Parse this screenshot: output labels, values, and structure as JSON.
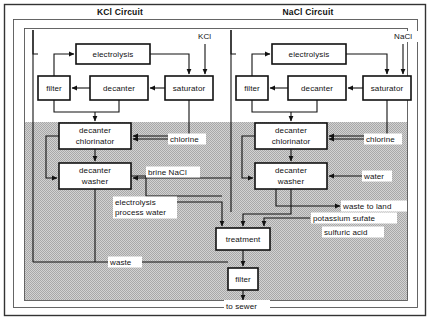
{
  "figure": {
    "type": "process-flow-diagram",
    "width": 430,
    "height": 320,
    "background_color": "#ffffff",
    "line_color": "#111111",
    "shaded_region_color": "#c8c8c8",
    "shaded_region_note": "stippled grey area covering lower portion of diagram"
  },
  "circuits": [
    {
      "id": "kcl",
      "title": "KCl Circuit"
    },
    {
      "id": "nacl",
      "title": "NaCl Circuit"
    }
  ],
  "nodes": {
    "kcl_electrolysis": {
      "label": "electrolysis",
      "x": 76,
      "y": 44,
      "w": 74,
      "h": 20
    },
    "kcl_filter": {
      "label": "filter",
      "x": 38,
      "y": 76,
      "w": 32,
      "h": 24
    },
    "kcl_decanter": {
      "label": "decanter",
      "x": 90,
      "y": 76,
      "w": 58,
      "h": 24
    },
    "kcl_saturator": {
      "label": "saturator",
      "x": 165,
      "y": 76,
      "w": 48,
      "h": 24
    },
    "kcl_decanter_chlorinator": {
      "label_line1": "decanter",
      "label_line2": "chlorinator",
      "x": 59,
      "y": 123,
      "w": 72,
      "h": 26
    },
    "kcl_decanter_washer": {
      "label_line1": "decanter",
      "label_line2": "washer",
      "x": 59,
      "y": 163,
      "w": 72,
      "h": 26
    },
    "nacl_electrolysis": {
      "label": "electrolysis",
      "x": 272,
      "y": 44,
      "w": 74,
      "h": 20
    },
    "nacl_filter": {
      "label": "filter",
      "x": 236,
      "y": 76,
      "w": 32,
      "h": 24
    },
    "nacl_decanter": {
      "label": "decanter",
      "x": 288,
      "y": 76,
      "w": 58,
      "h": 24
    },
    "nacl_saturator": {
      "label": "saturator",
      "x": 363,
      "y": 76,
      "w": 48,
      "h": 24
    },
    "nacl_decanter_chlorinator": {
      "label_line1": "decanter",
      "label_line2": "chlorinator",
      "x": 255,
      "y": 123,
      "w": 72,
      "h": 26
    },
    "nacl_decanter_washer": {
      "label_line1": "decanter",
      "label_line2": "washer",
      "x": 255,
      "y": 163,
      "w": 72,
      "h": 26
    },
    "treatment": {
      "label": "treatment",
      "x": 216,
      "y": 228,
      "w": 54,
      "h": 22
    },
    "bottom_filter": {
      "label": "filter",
      "x": 228,
      "y": 268,
      "w": 30,
      "h": 22
    }
  },
  "stream_labels": {
    "kcl_feed": "KCl",
    "nacl_feed": "NaCl",
    "chlorine_kcl": "chlorine",
    "chlorine_nacl": "chlorine",
    "brine_nacl": "brine NaCl",
    "water": "water",
    "waste_to_land": "waste to land",
    "potassium_sulfate": "potassium sufate",
    "sulfuric_acid": "sulfuric acid",
    "electrolysis_process_water_line1": "electrolysis",
    "electrolysis_process_water_line2": "process water",
    "waste": "waste",
    "to_sewer": "to sewer"
  }
}
